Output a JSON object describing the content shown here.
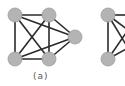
{
  "figure": {
    "panels": [
      {
        "label": "(a)",
        "nodes": [
          {
            "id": 1,
            "x": 15,
            "y": 15
          },
          {
            "id": 2,
            "x": 49,
            "y": 15
          },
          {
            "id": 3,
            "x": 75,
            "y": 37
          },
          {
            "id": 4,
            "x": 15,
            "y": 59
          },
          {
            "id": 5,
            "x": 49,
            "y": 59
          }
        ],
        "edges": [
          [
            1,
            2
          ],
          [
            1,
            4
          ],
          [
            2,
            5
          ],
          [
            4,
            5
          ],
          [
            1,
            5
          ],
          [
            2,
            4
          ],
          [
            1,
            3
          ],
          [
            2,
            3
          ],
          [
            4,
            3
          ],
          [
            5,
            3
          ]
        ]
      },
      {
        "label": "",
        "nodes": [
          {
            "id": 6,
            "x": 108,
            "y": 15
          },
          {
            "id": 7,
            "x": 108,
            "y": 59
          }
        ],
        "edges": [
          [
            6,
            7
          ]
        ],
        "partial_edges_offscreen": true
      }
    ],
    "colors": {
      "node_fill": "#b4b4b4",
      "edge": "#2a2a2a",
      "background": "#ffffff"
    }
  }
}
